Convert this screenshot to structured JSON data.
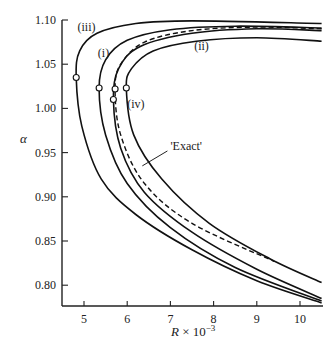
{
  "chart_data": {
    "type": "line",
    "title": "",
    "xlabel": "R × 10⁻³",
    "xlabel_parts": {
      "var": "R",
      "rest": " × 10",
      "exp": "−3"
    },
    "ylabel": "α",
    "xlim": [
      4.5,
      10.5
    ],
    "ylim": [
      0.775,
      1.1
    ],
    "xticks": [
      5,
      6,
      7,
      8,
      9,
      10
    ],
    "yticks": [
      0.8,
      0.85,
      0.9,
      0.95,
      1.0,
      1.05,
      1.1
    ],
    "ytick_labels": [
      "0.80",
      "0.85",
      "0.90",
      "0.95",
      "1.00",
      "1.05",
      "1.10"
    ],
    "grid": false,
    "legend": "inline labels",
    "series": [
      {
        "name": "(iii)",
        "style": "solid",
        "nose": {
          "R": 4.82,
          "alpha": 1.035
        },
        "upper": [
          [
            4.82,
            1.035
          ],
          [
            4.9,
            1.065
          ],
          [
            5.3,
            1.085
          ],
          [
            6.2,
            1.096
          ],
          [
            7.5,
            1.099
          ],
          [
            10.5,
            1.096
          ]
        ],
        "lower": [
          [
            4.82,
            1.035
          ],
          [
            4.95,
            0.98
          ],
          [
            5.4,
            0.92
          ],
          [
            6.2,
            0.88
          ],
          [
            7.5,
            0.84
          ],
          [
            9.0,
            0.805
          ],
          [
            10.5,
            0.78
          ]
        ]
      },
      {
        "name": "(i)",
        "style": "solid",
        "nose": {
          "R": 5.35,
          "alpha": 1.023
        },
        "upper": [
          [
            5.35,
            1.023
          ],
          [
            5.5,
            1.055
          ],
          [
            6.0,
            1.077
          ],
          [
            7.0,
            1.089
          ],
          [
            8.5,
            1.093
          ],
          [
            10.5,
            1.091
          ]
        ],
        "lower": [
          [
            5.35,
            1.023
          ],
          [
            5.5,
            0.97
          ],
          [
            6.0,
            0.915
          ],
          [
            7.0,
            0.865
          ],
          [
            8.5,
            0.82
          ],
          [
            10.5,
            0.782
          ]
        ]
      },
      {
        "name": "'Exact'",
        "style": "dashed",
        "nose": {
          "R": 5.72,
          "alpha": 1.022
        },
        "upper": [
          [
            5.72,
            1.022
          ],
          [
            5.85,
            1.05
          ],
          [
            6.4,
            1.075
          ],
          [
            7.5,
            1.088
          ],
          [
            9.0,
            1.092
          ],
          [
            10.5,
            1.09
          ]
        ],
        "lower": [
          [
            5.72,
            1.022
          ],
          [
            5.85,
            0.97
          ],
          [
            6.4,
            0.915
          ],
          [
            7.5,
            0.87
          ],
          [
            9.4,
            0.827
          ]
        ]
      },
      {
        "name": "(ii)",
        "style": "solid",
        "nose": {
          "R": 5.68,
          "alpha": 1.01
        },
        "upper": [
          [
            5.68,
            1.01
          ],
          [
            5.8,
            1.045
          ],
          [
            6.3,
            1.07
          ],
          [
            7.5,
            1.085
          ],
          [
            9.0,
            1.09
          ],
          [
            10.5,
            1.088
          ]
        ],
        "lower": [
          [
            5.68,
            1.01
          ],
          [
            5.85,
            0.955
          ],
          [
            6.4,
            0.905
          ],
          [
            7.5,
            0.86
          ],
          [
            9.0,
            0.818
          ],
          [
            10.5,
            0.785
          ]
        ]
      },
      {
        "name": "(iv)",
        "style": "solid",
        "nose": {
          "R": 5.98,
          "alpha": 1.023
        },
        "upper": [
          [
            5.98,
            1.023
          ],
          [
            6.1,
            1.045
          ],
          [
            6.6,
            1.065
          ],
          [
            7.6,
            1.076
          ],
          [
            9.0,
            1.08
          ],
          [
            10.5,
            1.076
          ]
        ],
        "lower": [
          [
            5.98,
            1.023
          ],
          [
            6.15,
            0.97
          ],
          [
            6.8,
            0.92
          ],
          [
            7.9,
            0.87
          ],
          [
            9.3,
            0.83
          ],
          [
            10.5,
            0.803
          ]
        ]
      }
    ],
    "annotations": [
      {
        "text": "(iii)",
        "R": 4.85,
        "alpha": 1.087
      },
      {
        "text": "(i)",
        "R": 5.32,
        "alpha": 1.058
      },
      {
        "text": "(ii)",
        "R": 7.55,
        "alpha": 1.066
      },
      {
        "text": "(iv)",
        "R": 6.0,
        "alpha": 1.001
      },
      {
        "text": "'Exact'",
        "R": 7.0,
        "alpha": 0.953,
        "arrow_to": {
          "R": 6.35,
          "alpha": 0.935
        }
      }
    ]
  }
}
